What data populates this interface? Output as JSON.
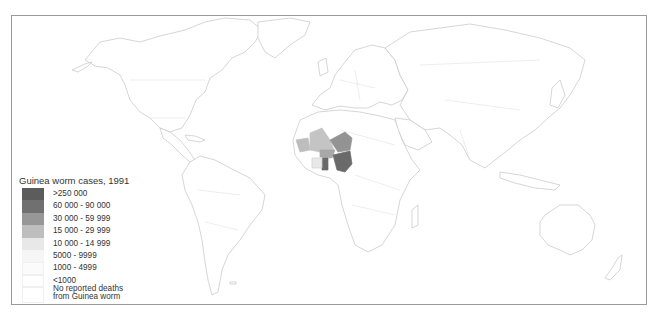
{
  "map": {
    "title": "Guinea worm cases, 1991",
    "region_highlight": "West Africa",
    "countries": [
      {
        "name": "Nigeria",
        "category": "60 000 - 90 000",
        "color": "#6a6a6a"
      },
      {
        "name": "Ghana",
        "category": "60 000 - 90 000",
        "color": "#6a6a6a"
      },
      {
        "name": "Niger",
        "category": "30 000 - 59 999",
        "color": "#939393"
      },
      {
        "name": "Mali",
        "category": "15 000 - 29 999",
        "color": "#bdbdbd"
      },
      {
        "name": "Burkina Faso",
        "category": "30 000 - 59 999",
        "color": "#939393"
      },
      {
        "name": "Mauritania",
        "category": "15 000 - 29 999",
        "color": "#bdbdbd"
      },
      {
        "name": "Cote d'Ivoire",
        "category": "10 000 - 14 999",
        "color": "#e6e6e6"
      }
    ]
  },
  "legend": {
    "title": "Guinea worm cases, 1991",
    "items": [
      {
        "label": ">250 000",
        "color": "#5c5c5c"
      },
      {
        "label": "60 000 - 90 000",
        "color": "#707070"
      },
      {
        "label": "30 000 - 59 999",
        "color": "#979797"
      },
      {
        "label": "15 000 - 29 999",
        "color": "#bebebe"
      },
      {
        "label": "10 000 - 14 999",
        "color": "#e8e8e8"
      },
      {
        "label": "5000 - 9999",
        "color": "#f6f6f6"
      },
      {
        "label": "1000 - 4999",
        "color": "#fbfbfb"
      },
      {
        "label": "<1000",
        "color": "#ffffff"
      },
      {
        "label": "No reported deaths",
        "color": "#ffffff"
      },
      {
        "label": "from Guinea worm",
        "color": ""
      }
    ]
  }
}
